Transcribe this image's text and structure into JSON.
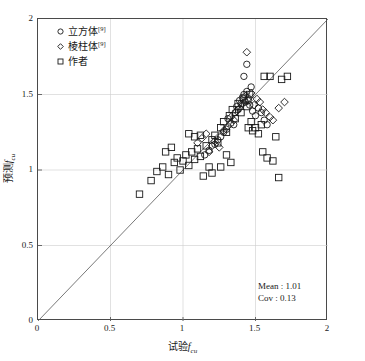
{
  "chart_data": {
    "type": "scatter",
    "title": "",
    "xlabel": "试验f_cu",
    "ylabel": "预测f_cu",
    "xlabel_cn": "试验",
    "ylabel_cn": "预测",
    "axis_symbol": "f",
    "axis_subscript": "cu",
    "xlim": [
      0,
      2
    ],
    "ylim": [
      0,
      2
    ],
    "xticks": [
      0,
      0.5,
      1,
      1.5,
      2
    ],
    "yticks": [
      0,
      0.5,
      1,
      1.5,
      2
    ],
    "xtick_labels": [
      "0",
      "0.5",
      "1",
      "1.5",
      "2"
    ],
    "ytick_labels": [
      "0",
      "0.5",
      "1",
      "1.5",
      "2"
    ],
    "grid": true,
    "grid_color": "#cccccc",
    "marker_color": "#1a1a1a",
    "reference_line": {
      "from": [
        0,
        0
      ],
      "to": [
        2,
        2
      ],
      "label": "1:1 line",
      "color": "#555555"
    },
    "legend_position": "top-left",
    "series": [
      {
        "name": "立方体",
        "reference": "[9]",
        "marker": "circle",
        "points": [
          [
            1.22,
            1.17
          ],
          [
            1.24,
            1.2
          ],
          [
            1.26,
            1.22
          ],
          [
            1.28,
            1.25
          ],
          [
            1.3,
            1.27
          ],
          [
            1.31,
            1.34
          ],
          [
            1.33,
            1.31
          ],
          [
            1.35,
            1.3
          ],
          [
            1.36,
            1.38
          ],
          [
            1.37,
            1.42
          ],
          [
            1.38,
            1.4
          ],
          [
            1.39,
            1.46
          ],
          [
            1.4,
            1.44
          ],
          [
            1.41,
            1.48
          ],
          [
            1.42,
            1.5
          ],
          [
            1.43,
            1.45
          ],
          [
            1.44,
            1.52
          ],
          [
            1.45,
            1.47
          ],
          [
            1.46,
            1.43
          ],
          [
            1.47,
            1.55
          ],
          [
            1.48,
            1.39
          ],
          [
            1.5,
            1.36
          ],
          [
            1.52,
            1.41
          ],
          [
            1.54,
            1.38
          ],
          [
            1.56,
            1.33
          ],
          [
            1.58,
            1.3
          ],
          [
            1.42,
            1.62
          ],
          [
            1.44,
            1.7
          ],
          [
            1.15,
            1.1
          ],
          [
            1.18,
            1.13
          ]
        ]
      },
      {
        "name": "棱柱体",
        "reference": "[9]",
        "marker": "diamond",
        "points": [
          [
            1.18,
            1.12
          ],
          [
            1.2,
            1.16
          ],
          [
            1.22,
            1.19
          ],
          [
            1.25,
            1.15
          ],
          [
            1.28,
            1.26
          ],
          [
            1.31,
            1.29
          ],
          [
            1.33,
            1.35
          ],
          [
            1.35,
            1.33
          ],
          [
            1.37,
            1.39
          ],
          [
            1.39,
            1.41
          ],
          [
            1.41,
            1.44
          ],
          [
            1.43,
            1.49
          ],
          [
            1.45,
            1.46
          ],
          [
            1.47,
            1.51
          ],
          [
            1.49,
            1.43
          ],
          [
            1.51,
            1.47
          ],
          [
            1.53,
            1.45
          ],
          [
            1.55,
            1.4
          ],
          [
            1.57,
            1.38
          ],
          [
            1.6,
            1.35
          ],
          [
            1.62,
            1.33
          ],
          [
            1.66,
            1.41
          ],
          [
            1.7,
            1.45
          ],
          [
            1.44,
            1.78
          ],
          [
            1.1,
            1.18
          ],
          [
            1.13,
            1.21
          ],
          [
            1.16,
            1.24
          ]
        ]
      },
      {
        "name": "作者",
        "reference": "",
        "marker": "square",
        "points": [
          [
            0.7,
            0.84
          ],
          [
            0.78,
            0.93
          ],
          [
            0.82,
            0.99
          ],
          [
            0.86,
            1.02
          ],
          [
            0.9,
            0.97
          ],
          [
            0.94,
            1.05
          ],
          [
            0.96,
            1.08
          ],
          [
            0.98,
            1.0
          ],
          [
            1.0,
            1.06
          ],
          [
            1.02,
            1.1
          ],
          [
            1.04,
            1.03
          ],
          [
            1.06,
            1.12
          ],
          [
            1.08,
            1.07
          ],
          [
            1.1,
            1.14
          ],
          [
            1.12,
            1.09
          ],
          [
            1.14,
            0.96
          ],
          [
            1.16,
            1.16
          ],
          [
            1.18,
            1.02
          ],
          [
            1.2,
            1.2
          ],
          [
            1.22,
            1.23
          ],
          [
            1.24,
            1.18
          ],
          [
            1.26,
            1.28
          ],
          [
            1.28,
            1.32
          ],
          [
            1.3,
            1.25
          ],
          [
            1.32,
            1.36
          ],
          [
            1.34,
            1.4
          ],
          [
            1.36,
            1.34
          ],
          [
            1.38,
            1.44
          ],
          [
            1.4,
            1.38
          ],
          [
            1.42,
            1.47
          ],
          [
            1.44,
            1.42
          ],
          [
            1.46,
            1.5
          ],
          [
            1.48,
            1.26
          ],
          [
            1.5,
            1.28
          ],
          [
            1.52,
            1.24
          ],
          [
            1.54,
            1.3
          ],
          [
            1.56,
            1.62
          ],
          [
            1.6,
            1.62
          ],
          [
            1.64,
            1.22
          ],
          [
            1.68,
            1.6
          ],
          [
            1.72,
            1.62
          ],
          [
            1.55,
            1.12
          ],
          [
            1.58,
            1.08
          ],
          [
            1.62,
            1.06
          ],
          [
            1.66,
            0.95
          ],
          [
            1.3,
            1.1
          ],
          [
            1.33,
            1.05
          ],
          [
            1.26,
            1.02
          ],
          [
            1.2,
            0.98
          ],
          [
            1.12,
            1.23
          ],
          [
            1.08,
            1.22
          ],
          [
            1.04,
            1.24
          ],
          [
            0.88,
            1.12
          ],
          [
            0.92,
            1.15
          ],
          [
            1.45,
            1.28
          ],
          [
            1.47,
            1.32
          ]
        ]
      }
    ],
    "statistics": {
      "mean_label": "Mean : 1.01",
      "cov_label": "Cov : 0.13",
      "mean": 1.01,
      "cov": 0.13
    }
  },
  "legend": {
    "items": [
      {
        "label": "立方体",
        "sup": "[9]",
        "marker": "circle"
      },
      {
        "label": "棱柱体",
        "sup": "[9]",
        "marker": "diamond"
      },
      {
        "label": "作者",
        "sup": "",
        "marker": "square"
      }
    ]
  }
}
